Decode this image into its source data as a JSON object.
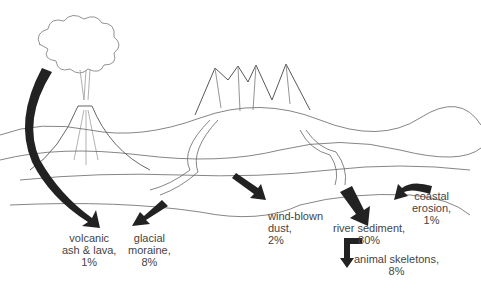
{
  "diagram": {
    "sources": [
      {
        "id": "volcanic",
        "line1": "volcanic",
        "line2": "ash & lava,",
        "line3": "1%"
      },
      {
        "id": "glacial",
        "line1": "glacial",
        "line2": "moraine,",
        "line3": "8%"
      },
      {
        "id": "wind",
        "line1": "wind-blown",
        "line2": "dust,",
        "line3": "2%"
      },
      {
        "id": "river",
        "line1": "river sediment,",
        "line2": "80%"
      },
      {
        "id": "coastal",
        "line1": "coastal",
        "line2": "erosion,",
        "line3": "1%"
      },
      {
        "id": "animal",
        "line1": "animal skeletons,",
        "line2": "8%"
      }
    ],
    "colors": {
      "arrow": "#222222",
      "line": "#555555",
      "text": "#444444"
    }
  }
}
